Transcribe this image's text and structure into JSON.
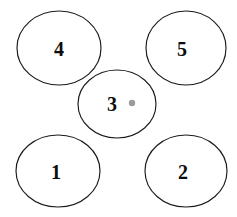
{
  "diagram": {
    "type": "node-cluster",
    "background_color": "#ffffff",
    "stroke_color": "#1a1a1a",
    "label_color": "#0d0d0d",
    "nodes": [
      {
        "id": "node-4",
        "label": "4",
        "position": "top-left",
        "cx": 59,
        "cy": 48,
        "rx": 42,
        "ry": 37
      },
      {
        "id": "node-5",
        "label": "5",
        "position": "top-right",
        "cx": 186,
        "cy": 48,
        "rx": 40,
        "ry": 37
      },
      {
        "id": "node-3",
        "label": "3",
        "position": "center",
        "cx": 117,
        "cy": 104,
        "rx": 39,
        "ry": 34
      },
      {
        "id": "node-1",
        "label": "1",
        "position": "bottom-left",
        "cx": 58,
        "cy": 171,
        "rx": 42,
        "ry": 36
      },
      {
        "id": "node-2",
        "label": "2",
        "position": "bottom-right",
        "cx": 186,
        "cy": 171,
        "rx": 41,
        "ry": 36
      }
    ],
    "marker": {
      "id": "marker-dot",
      "color": "#9b9b9b",
      "cx": 132,
      "cy": 103,
      "r": 3.2,
      "inside_node": "node-3"
    }
  }
}
